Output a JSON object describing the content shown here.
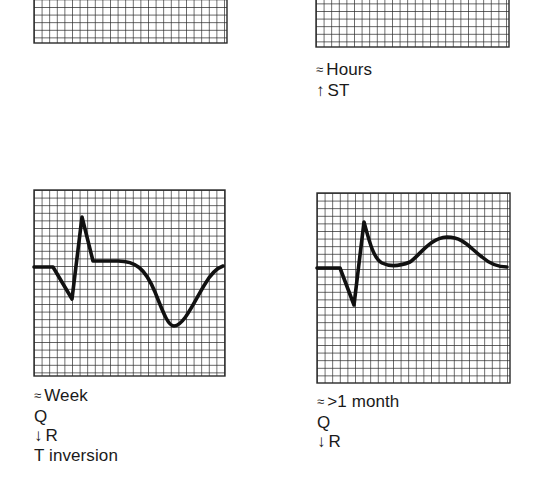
{
  "figure": {
    "grid": {
      "cell_px": 7.6,
      "line_color": "#2a2a2a",
      "background": "#ffffff",
      "trace_color": "#111111"
    },
    "panels": [
      {
        "id": "top-left",
        "box": {
          "x": 34,
          "y": -145,
          "w": 193,
          "h": 188
        },
        "trace": null,
        "caption": []
      },
      {
        "id": "top-right",
        "box": {
          "x": 316,
          "y": -141,
          "w": 193,
          "h": 188
        },
        "trace": null,
        "caption": [
          {
            "symbol": "≈",
            "text": "Hours"
          },
          {
            "symbol": "↑",
            "text": "ST"
          }
        ]
      },
      {
        "id": "bottom-left",
        "box": {
          "x": 34,
          "y": 190,
          "w": 191,
          "h": 186
        },
        "trace": "M34,267 L53,267 L72,299 L82,217 L93,261 L118,261 C135,261 145,268 155,292 C163,312 168,326 174,326 C184,326 195,300 205,284 C212,272 217,268 223,266",
        "caption": [
          {
            "symbol": "≈",
            "text": "Week"
          },
          {
            "symbol": "",
            "text": "Q"
          },
          {
            "symbol": "↓",
            "text": "R"
          },
          {
            "symbol": "",
            "text": "T inversion"
          }
        ]
      },
      {
        "id": "bottom-right",
        "box": {
          "x": 317,
          "y": 193,
          "w": 193,
          "h": 190
        },
        "trace": "M317,268 L340,268 L354,305 L364,222 C369,240 373,258 382,263 C390,267 400,266 410,262 C420,255 430,238 447,237 C463,237 470,248 482,257 C490,264 498,267 507,267",
        "caption": [
          {
            "symbol": "≈",
            "text": ">1 month"
          },
          {
            "symbol": "",
            "text": "Q"
          },
          {
            "symbol": "↓",
            "text": "R"
          }
        ]
      }
    ]
  },
  "captions": {
    "top_right": {
      "line1_symbol": "≈",
      "line1_text": "Hours",
      "line2_symbol": "↑",
      "line2_text": "ST"
    },
    "bottom_left": {
      "line1_symbol": "≈",
      "line1_text": "Week",
      "line2_text": "Q",
      "line3_symbol": "↓",
      "line3_text": "R",
      "line4_text": "T inversion"
    },
    "bottom_right": {
      "line1_symbol": "≈",
      "line1_text": ">1 month",
      "line2_text": "Q",
      "line3_symbol": "↓",
      "line3_text": "R"
    }
  }
}
